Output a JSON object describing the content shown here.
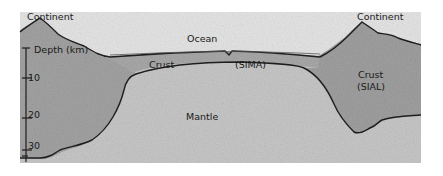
{
  "diagram": {
    "labels": {
      "continent_left": "Continent",
      "continent_right": "Continent",
      "ocean": "Ocean",
      "oceanic_crust": "Crust",
      "sima": "(SIMA)",
      "continental_crust": "Crust",
      "sial": "(SIAL)",
      "mantle": "Mantle",
      "depth_axis": "Depth (km)"
    },
    "depth_ticks": [
      "10",
      "20",
      "30"
    ],
    "colors": {
      "background": "#ffffff",
      "ocean": "#e4e4e4",
      "continental_crust": "#9c9c9c",
      "oceanic_crust": "#a6a6a6",
      "mantle": "#c9c9c9",
      "outline": "#1e1e1e"
    }
  }
}
